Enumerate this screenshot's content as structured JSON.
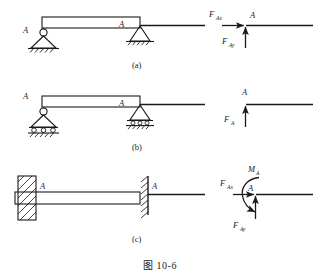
{
  "figure": {
    "caption": "图 10-6",
    "rows": [
      {
        "id": "a",
        "row_label": "(a)",
        "support_type": "pin-support",
        "point_label_real": "A",
        "point_label_schematic": "A",
        "point_label_fbd": "A",
        "forces": [
          {
            "name": "F_Ax",
            "base": "F",
            "sub": "Ax",
            "direction": "horizontal-right"
          },
          {
            "name": "F_Ay",
            "base": "F",
            "sub": "Ay",
            "direction": "vertical-up"
          }
        ],
        "moment": null
      },
      {
        "id": "b",
        "row_label": "(b)",
        "support_type": "roller-support",
        "point_label_real": "A",
        "point_label_schematic": "A",
        "point_label_fbd": "A",
        "forces": [
          {
            "name": "F_A",
            "base": "F",
            "sub": "A",
            "direction": "vertical-up"
          }
        ],
        "moment": null
      },
      {
        "id": "c",
        "row_label": "(c)",
        "support_type": "fixed-support",
        "point_label_real": "A",
        "point_label_schematic": "A",
        "point_label_fbd": "A",
        "forces": [
          {
            "name": "F_Ax",
            "base": "F",
            "sub": "Ax",
            "direction": "horizontal-right"
          },
          {
            "name": "F_Ay",
            "base": "F",
            "sub": "Ay",
            "direction": "vertical-up"
          }
        ],
        "moment": {
          "name": "M_A",
          "base": "M",
          "sub": "A",
          "direction": "counter-clockwise"
        }
      }
    ]
  },
  "colors": {
    "ink": "#1a1a1a",
    "paper": "#ffffff"
  }
}
